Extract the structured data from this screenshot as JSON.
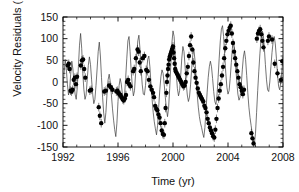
{
  "figure": {
    "background_color": "#ffffff",
    "frame_color": "#000000",
    "line_color": "#3a3a3a",
    "marker_color": "#000000"
  },
  "axes": {
    "x_label": "Time (yr)",
    "y_label_main": "Velocity Residuals (m s",
    "y_label_exp": "-1",
    "y_label_close": ")",
    "x_ticks": [
      "1992",
      "1996",
      "2000",
      "2004",
      "2008"
    ],
    "y_ticks": [
      "150",
      "100",
      "50",
      "0",
      "-50",
      "-100",
      "-150"
    ]
  },
  "chart_data": {
    "type": "scatter",
    "title": "",
    "xlabel": "Time (yr)",
    "ylabel": "Velocity Residuals (m s^-1)",
    "xlim": [
      1992,
      2008
    ],
    "ylim": [
      -150,
      150
    ],
    "x_major_tick_interval": 4,
    "y_major_tick_interval": 50,
    "x_minor_tick_interval": 1,
    "y_minor_tick_interval": 10,
    "grid": false,
    "legend": null,
    "series": [
      {
        "name": "Model fit",
        "type": "line",
        "color": "#3a3a3a",
        "x": [
          1992.0,
          1992.08,
          1992.16,
          1992.24,
          1992.32,
          1992.4,
          1992.48,
          1992.56,
          1992.64,
          1992.72,
          1992.8,
          1992.88,
          1992.96,
          1993.04,
          1993.12,
          1993.2,
          1993.28,
          1993.36,
          1993.44,
          1993.52,
          1993.6,
          1993.68,
          1993.76,
          1993.84,
          1993.92,
          1994.0,
          1994.08,
          1994.16,
          1994.24,
          1994.32,
          1994.4,
          1994.48,
          1994.56,
          1994.64,
          1994.72,
          1994.8,
          1994.88,
          1994.96,
          1995.04,
          1995.12,
          1995.2,
          1995.28,
          1995.36,
          1995.44,
          1995.52,
          1995.6,
          1995.68,
          1995.76,
          1995.84,
          1995.92,
          1996.0,
          1996.08,
          1996.16,
          1996.24,
          1996.32,
          1996.4,
          1996.48,
          1996.56,
          1996.64,
          1996.72,
          1996.8,
          1996.88,
          1996.96,
          1997.04,
          1997.12,
          1997.2,
          1997.28,
          1997.36,
          1997.44,
          1997.52,
          1997.6,
          1997.68,
          1997.76,
          1997.84,
          1997.92,
          1998.0,
          1998.08,
          1998.16,
          1998.24,
          1998.32,
          1998.4,
          1998.48,
          1998.56,
          1998.64,
          1998.72,
          1998.8,
          1998.88,
          1998.96,
          1999.04,
          1999.12,
          1999.2,
          1999.28,
          1999.36,
          1999.44,
          1999.52,
          1999.6,
          1999.68,
          1999.76,
          1999.84,
          1999.92,
          2000.0,
          2000.08,
          2000.16,
          2000.24,
          2000.32,
          2000.4,
          2000.48,
          2000.56,
          2000.64,
          2000.72,
          2000.8,
          2000.88,
          2000.96,
          2001.04,
          2001.12,
          2001.2,
          2001.28,
          2001.36,
          2001.44,
          2001.52,
          2001.6,
          2001.68,
          2001.76,
          2001.84,
          2001.92,
          2002.0,
          2002.08,
          2002.16,
          2002.24,
          2002.32,
          2002.4,
          2002.48,
          2002.56,
          2002.64,
          2002.72,
          2002.8,
          2002.88,
          2002.96,
          2003.04,
          2003.12,
          2003.2,
          2003.28,
          2003.36,
          2003.44,
          2003.52,
          2003.6,
          2003.68,
          2003.76,
          2003.84,
          2003.92,
          2004.0,
          2004.08,
          2004.16,
          2004.24,
          2004.32,
          2004.4,
          2004.48,
          2004.56,
          2004.64,
          2004.72,
          2004.8,
          2004.88,
          2004.96,
          2005.04,
          2005.12,
          2005.2,
          2005.28,
          2005.36,
          2005.44,
          2005.52,
          2005.6,
          2005.68,
          2005.76,
          2005.84,
          2005.92,
          2006.0,
          2006.08,
          2006.16,
          2006.24,
          2006.32,
          2006.4,
          2006.48,
          2006.56,
          2006.64,
          2006.72,
          2006.8,
          2006.88,
          2006.96,
          2007.04,
          2007.12,
          2007.2,
          2007.28,
          2007.36,
          2007.44,
          2007.52,
          2007.6,
          2007.68,
          2007.76,
          2007.84,
          2007.92,
          2008.0
        ],
        "y": [
          -8,
          20,
          52,
          30,
          -5,
          -30,
          -18,
          18,
          48,
          30,
          -2,
          -28,
          -40,
          -12,
          35,
          85,
          112,
          78,
          20,
          -18,
          -40,
          -30,
          5,
          38,
          58,
          40,
          5,
          -28,
          -50,
          -40,
          -8,
          30,
          70,
          92,
          60,
          10,
          -35,
          -72,
          -95,
          -70,
          -28,
          5,
          18,
          0,
          -30,
          -62,
          -88,
          -110,
          -126,
          -95,
          -45,
          -8,
          8,
          -5,
          -28,
          -48,
          -30,
          10,
          55,
          95,
          105,
          70,
          25,
          -10,
          -32,
          -20,
          20,
          62,
          95,
          108,
          75,
          30,
          -5,
          -28,
          -30,
          -8,
          25,
          52,
          60,
          35,
          -5,
          -40,
          -70,
          -92,
          -108,
          -122,
          -100,
          -58,
          -18,
          12,
          28,
          20,
          -5,
          -35,
          -62,
          -80,
          -60,
          -15,
          40,
          90,
          118,
          105,
          62,
          18,
          -15,
          -32,
          -20,
          15,
          55,
          82,
          70,
          35,
          -2,
          -30,
          -45,
          -35,
          -5,
          32,
          62,
          75,
          50,
          10,
          -28,
          -58,
          -80,
          -95,
          -105,
          -118,
          -128,
          -105,
          -65,
          -25,
          10,
          35,
          48,
          35,
          8,
          -22,
          -45,
          -52,
          -30,
          10,
          55,
          95,
          122,
          130,
          105,
          62,
          20,
          -12,
          -28,
          -20,
          8,
          45,
          78,
          95,
          75,
          38,
          0,
          -28,
          -42,
          -35,
          -8,
          28,
          58,
          72,
          52,
          15,
          -25,
          -58,
          -82,
          -100,
          -118,
          -135,
          -142,
          -118,
          -70,
          -20,
          25,
          65,
          98,
          118,
          112,
          80,
          40,
          5,
          -18,
          -22,
          0,
          35,
          68,
          92,
          105,
          88,
          55,
          18,
          -10,
          -18,
          0,
          28,
          52
        ],
        "marker": "none",
        "linewidth": 0.7
      },
      {
        "name": "Observed velocity residuals",
        "type": "scatter",
        "color": "#000000",
        "marker": "filled-circle",
        "marker_size": 2.2,
        "has_error_bars": true,
        "typical_error": 10,
        "x": [
          1992.35,
          1992.42,
          1992.48,
          1992.55,
          1992.62,
          1992.7,
          1992.78,
          1992.86,
          1992.94,
          1993.02,
          1993.3,
          1993.38,
          1993.46,
          1993.54,
          1993.62,
          1993.95,
          1994.05,
          1994.6,
          1994.68,
          1994.78,
          1995.0,
          1995.12,
          1995.35,
          1995.48,
          1995.6,
          1995.88,
          1995.95,
          1996.02,
          1996.1,
          1996.18,
          1996.26,
          1996.34,
          1996.42,
          1996.5,
          1996.58,
          1996.66,
          1996.74,
          1996.82,
          1996.9,
          1997.1,
          1997.18,
          1997.3,
          1997.42,
          1997.5,
          1997.58,
          1997.66,
          1997.8,
          1997.92,
          1998.05,
          1998.15,
          1998.25,
          1998.35,
          1998.45,
          1998.55,
          1998.62,
          1998.7,
          1998.78,
          1998.86,
          1998.94,
          1999.02,
          1999.1,
          1999.18,
          1999.26,
          1999.34,
          1999.4,
          1999.46,
          1999.52,
          1999.56,
          1999.6,
          1999.64,
          1999.68,
          1999.72,
          1999.76,
          1999.8,
          1999.84,
          1999.88,
          1999.92,
          1999.96,
          2000.0,
          2000.04,
          2000.08,
          2000.12,
          2000.16,
          2000.2,
          2000.28,
          2000.36,
          2000.44,
          2000.52,
          2000.6,
          2000.68,
          2000.76,
          2000.84,
          2000.92,
          2001.0,
          2001.08,
          2001.16,
          2001.24,
          2001.32,
          2001.4,
          2001.48,
          2001.56,
          2001.64,
          2001.72,
          2001.8,
          2001.88,
          2001.96,
          2002.04,
          2002.12,
          2002.2,
          2002.28,
          2002.36,
          2002.44,
          2002.52,
          2002.6,
          2002.68,
          2002.76,
          2002.84,
          2002.92,
          2003.0,
          2003.08,
          2003.16,
          2003.24,
          2003.32,
          2003.4,
          2003.48,
          2003.56,
          2003.64,
          2003.72,
          2003.8,
          2003.88,
          2003.96,
          2004.04,
          2004.12,
          2004.2,
          2004.28,
          2004.36,
          2004.44,
          2004.52,
          2004.6,
          2004.68,
          2004.76,
          2004.84,
          2004.92,
          2005.0,
          2005.08,
          2005.16,
          2005.7,
          2005.78,
          2005.86,
          2006.1,
          2006.18,
          2006.26,
          2006.34,
          2006.42,
          2006.5,
          2006.58,
          2006.9,
          2006.98,
          2007.2,
          2007.4,
          2007.6,
          2007.85,
          2007.95
        ],
        "y": [
          38,
          42,
          30,
          -20,
          -22,
          -18,
          5,
          10,
          -5,
          12,
          38,
          50,
          52,
          30,
          10,
          -20,
          -18,
          -58,
          -78,
          -95,
          -22,
          -20,
          -8,
          -12,
          -18,
          -22,
          -20,
          -25,
          -28,
          -30,
          -35,
          -40,
          -42,
          -38,
          -30,
          0,
          5,
          -5,
          -10,
          25,
          30,
          55,
          75,
          70,
          45,
          25,
          55,
          60,
          28,
          25,
          5,
          -10,
          -18,
          -25,
          -35,
          -55,
          -62,
          -65,
          -75,
          -82,
          -95,
          -112,
          -120,
          -122,
          -95,
          -60,
          -25,
          0,
          15,
          30,
          40,
          52,
          58,
          62,
          66,
          70,
          74,
          78,
          82,
          68,
          55,
          42,
          30,
          25,
          20,
          15,
          10,
          5,
          0,
          -5,
          -10,
          -8,
          0,
          20,
          35,
          60,
          85,
          105,
          75,
          45,
          25,
          10,
          -2,
          -15,
          -25,
          -30,
          -35,
          -40,
          -45,
          -55,
          -60,
          -70,
          -85,
          -95,
          -105,
          -112,
          -118,
          -125,
          -128,
          -110,
          -85,
          -60,
          -38,
          -20,
          -5,
          15,
          35,
          55,
          78,
          95,
          110,
          118,
          125,
          130,
          112,
          90,
          70,
          55,
          40,
          25,
          10,
          -5,
          -12,
          -20,
          -28,
          -18,
          -118,
          -130,
          -142,
          100,
          112,
          118,
          122,
          110,
          95,
          80,
          95,
          105,
          98,
          42,
          20,
          5,
          48
        ],
        "npoints": 163
      }
    ]
  }
}
